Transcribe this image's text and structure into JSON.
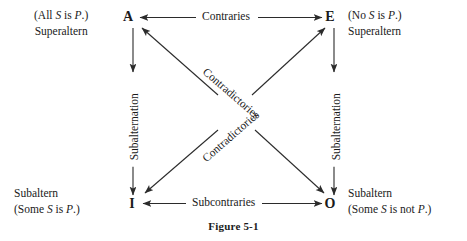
{
  "figure": {
    "caption": "Figure 5-1",
    "line_color": "#2b2b2b"
  },
  "vertices": {
    "a": {
      "letter": "A"
    },
    "e": {
      "letter": "E"
    },
    "i": {
      "letter": "I"
    },
    "o": {
      "letter": "O"
    }
  },
  "corner_blocks": {
    "a": {
      "proposition_open": "(All ",
      "proposition_subject": "S",
      "proposition_mid": " is ",
      "proposition_predicate": "P",
      "proposition_close": ".)",
      "role": "Superaltern"
    },
    "e": {
      "proposition_open": "(No ",
      "proposition_subject": "S",
      "proposition_mid": " is ",
      "proposition_predicate": "P",
      "proposition_close": ".)",
      "role": "Superaltern"
    },
    "i": {
      "role": "Subaltern",
      "proposition_open": "(Some ",
      "proposition_subject": "S",
      "proposition_mid": " is ",
      "proposition_predicate": "P",
      "proposition_close": ".)"
    },
    "o": {
      "role": "Subaltern",
      "proposition_open": "(Some ",
      "proposition_subject": "S",
      "proposition_mid": " is not ",
      "proposition_predicate": "P",
      "proposition_close": ".)"
    }
  },
  "edges": {
    "top": "Contraries",
    "bottom": "Subcontraries",
    "left_vertical": "Subalternation",
    "right_vertical": "Subalternation",
    "diagonal_down": "Contradictories",
    "diagonal_up": "Contradictories"
  }
}
